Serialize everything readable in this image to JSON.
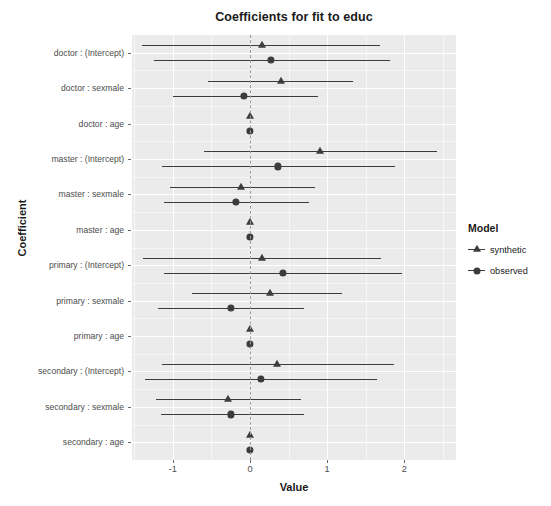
{
  "chart_data": {
    "type": "scatter",
    "title": "Coefficients for fit to educ",
    "xlabel": "Value",
    "ylabel": "Coefficient",
    "xlim": [
      -1.53,
      2.67
    ],
    "xticks": [
      -1,
      0,
      1,
      2
    ],
    "xtick_labels": [
      "-1",
      "0",
      "1",
      "2"
    ],
    "grid": true,
    "legend_position": "right",
    "legend_title": "Model",
    "zero_reference_line": 0,
    "categories": [
      "doctor : (Intercept)",
      "doctor : sexmale",
      "doctor : age",
      "master : (Intercept)",
      "master : sexmale",
      "master : age",
      "primary : (Intercept)",
      "primary : sexmale",
      "primary : age",
      "secondary : (Intercept)",
      "secondary : sexmale",
      "secondary : age"
    ],
    "series": [
      {
        "name": "synthetic",
        "marker": "triangle",
        "color": "#3c3c3c",
        "values": [
          0.16,
          0.4,
          0.0,
          0.91,
          -0.12,
          0.0,
          0.16,
          0.26,
          0.0,
          0.35,
          -0.29,
          0.0
        ],
        "ci_low": [
          -1.4,
          -0.55,
          0.0,
          -0.6,
          -1.04,
          0.0,
          -1.39,
          -0.75,
          0.0,
          -1.14,
          -1.22,
          0.0
        ],
        "ci_high": [
          1.69,
          1.34,
          0.0,
          2.43,
          0.84,
          0.0,
          1.7,
          1.19,
          0.0,
          1.87,
          0.66,
          0.0
        ]
      },
      {
        "name": "observed",
        "marker": "circle",
        "color": "#3c3c3c",
        "values": [
          0.27,
          -0.08,
          0.0,
          0.36,
          -0.18,
          0.0,
          0.43,
          -0.25,
          0.0,
          0.14,
          -0.25,
          0.0
        ],
        "ci_low": [
          -1.25,
          -1.0,
          0.0,
          -1.14,
          -1.12,
          0.0,
          -1.12,
          -1.19,
          0.0,
          -1.36,
          -1.16,
          0.0
        ],
        "ci_high": [
          1.82,
          0.88,
          0.0,
          1.88,
          0.77,
          0.0,
          1.97,
          0.7,
          0.0,
          1.64,
          0.7,
          0.0
        ]
      }
    ]
  },
  "legend": {
    "title": "Model",
    "items": [
      {
        "label": "synthetic",
        "marker": "triangle"
      },
      {
        "label": "observed",
        "marker": "circle"
      }
    ]
  }
}
